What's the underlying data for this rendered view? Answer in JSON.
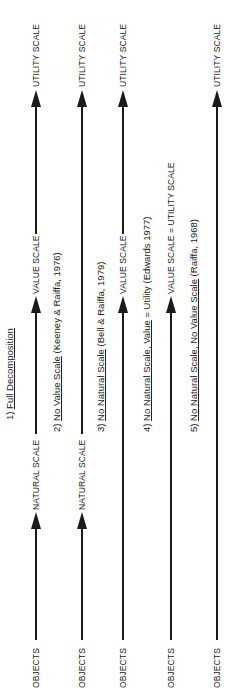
{
  "diagram": {
    "captions": [
      {
        "num": "1)",
        "title": "Full Decomposition",
        "ref": ""
      },
      {
        "num": "2)",
        "title": "No Value Scale",
        "ref": " (Keeney & Raiffa, 1976)"
      },
      {
        "num": "3)",
        "title": "No Natural Scale",
        "ref": " (Bell & Raiffa, 1979)"
      },
      {
        "num": "4)",
        "title": "No Natural Scale, Value",
        "ref": " = Utility (Edwards 1977)"
      },
      {
        "num": "5)",
        "title": "No Natural Scale, No Value Scale",
        "ref": " (Raiffa, 1968)"
      }
    ],
    "columns": [
      {
        "nodes": [
          "OBJECTS",
          "NATURAL SCALE",
          "VALUE SCALE",
          "UTILITY SCALE"
        ]
      },
      {
        "nodes": [
          "OBJECTS",
          "NATURAL SCALE",
          "UTILITY SCALE"
        ]
      },
      {
        "nodes": [
          "OBJECTS",
          "VALUE SCALE",
          "UTILITY SCALE"
        ]
      },
      {
        "nodes": [
          "OBJECTS",
          "VALUE SCALE = UTILITY SCALE"
        ]
      },
      {
        "nodes": [
          "OBJECTS",
          "UTILITY SCALE"
        ]
      }
    ],
    "line_color": "#1a1a1a",
    "background": "#ffffff"
  }
}
